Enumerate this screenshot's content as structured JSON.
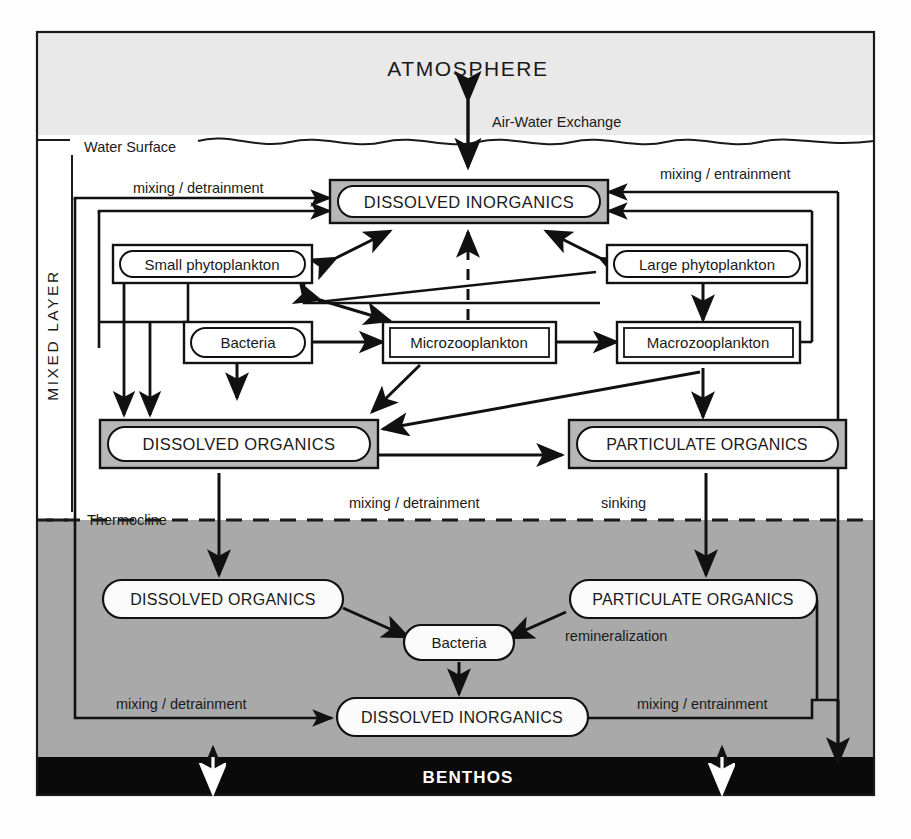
{
  "figure": {
    "type": "ocean-biogeochemical-flow-diagram",
    "zones": {
      "atmosphere": {
        "label": "ATMOSPHERE",
        "color": "#e9e9e9"
      },
      "water_surface": {
        "label": "Water Surface"
      },
      "mixed_layer": {
        "label": "MIXED LAYER",
        "color": "#ffffff"
      },
      "thermocline": {
        "label": "Thermocline"
      },
      "deep_water": {
        "color": "#a9a9a9"
      },
      "benthos": {
        "label": "BENTHOS",
        "color": "#0a0a0a",
        "text_color": "#ffffff"
      }
    },
    "compartments": {
      "mixed_layer": [
        {
          "id": "di-top",
          "label": "DISSOLVED INORGANICS",
          "style": "shaded-pill"
        },
        {
          "id": "small-phyto",
          "label": "Small phytoplankton",
          "style": "outlined-pill"
        },
        {
          "id": "large-phyto",
          "label": "Large phytoplankton",
          "style": "outlined-pill"
        },
        {
          "id": "bacteria-ml",
          "label": "Bacteria",
          "style": "outlined-pill"
        },
        {
          "id": "microzoo",
          "label": "Microzooplankton",
          "style": "outlined-rect"
        },
        {
          "id": "macrozoo",
          "label": "Macrozooplankton",
          "style": "outlined-rect"
        },
        {
          "id": "do-ml",
          "label": "DISSOLVED ORGANICS",
          "style": "shaded-pill"
        },
        {
          "id": "po-ml",
          "label": "PARTICULATE ORGANICS",
          "style": "shaded-pill"
        }
      ],
      "deep_water": [
        {
          "id": "do-deep",
          "label": "DISSOLVED ORGANICS",
          "style": "white-pill"
        },
        {
          "id": "po-deep",
          "label": "PARTICULATE ORGANICS",
          "style": "white-pill"
        },
        {
          "id": "bacteria-deep",
          "label": "Bacteria",
          "style": "white-pill"
        },
        {
          "id": "di-deep",
          "label": "DISSOLVED INORGANICS",
          "style": "white-pill"
        }
      ]
    },
    "process_labels": [
      {
        "id": "air-water",
        "text": "Air-Water Exchange"
      },
      {
        "id": "mix-detrain-top",
        "text": "mixing / detrainment"
      },
      {
        "id": "mix-entrain-top",
        "text": "mixing / entrainment"
      },
      {
        "id": "mix-detrain-mid",
        "text": "mixing / detrainment"
      },
      {
        "id": "sinking",
        "text": "sinking"
      },
      {
        "id": "remineralization",
        "text": "remineralization"
      },
      {
        "id": "mix-detrain-bottom",
        "text": "mixing / detrainment"
      },
      {
        "id": "mix-entrain-bottom",
        "text": "mixing / entrainment"
      }
    ]
  }
}
